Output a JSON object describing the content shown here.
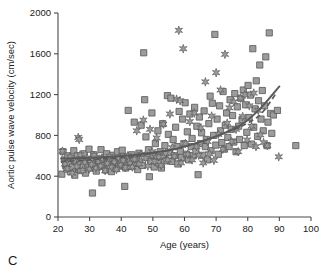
{
  "panel": {
    "letter": "C"
  },
  "chart_data": {
    "type": "scatter",
    "title": "",
    "xlabel": "Age (years)",
    "ylabel": "Aortic pulse wave velocity (cm/sec)",
    "xlim": [
      20,
      100
    ],
    "ylim": [
      0,
      2000
    ],
    "xticks": [
      20,
      30,
      40,
      50,
      60,
      70,
      80,
      90,
      100
    ],
    "yticks": [
      0,
      400,
      800,
      1200,
      1600,
      2000
    ],
    "xtick_labels": [
      "20",
      "30",
      "40",
      "50",
      "60",
      "70",
      "80",
      "90",
      "100"
    ],
    "ytick_labels": [
      "0",
      "400",
      "800",
      "1200",
      "1600",
      "2000"
    ],
    "grid": false,
    "legend": "none",
    "colors": {
      "marker_fill": "#9c9c9c",
      "marker_edge": "#5c5c5c",
      "trend_line": "#595959",
      "axis": "#4a4a4a"
    },
    "series": [
      {
        "name": "squares",
        "marker": "square",
        "points": [
          [
            21.2,
            420
          ],
          [
            21.6,
            640
          ],
          [
            22.0,
            560
          ],
          [
            22.4,
            505
          ],
          [
            22.8,
            470
          ],
          [
            23.1,
            600
          ],
          [
            23.5,
            525
          ],
          [
            23.9,
            445
          ],
          [
            24.2,
            575
          ],
          [
            24.6,
            490
          ],
          [
            25.0,
            650
          ],
          [
            25.3,
            410
          ],
          [
            25.7,
            540
          ],
          [
            26.1,
            600
          ],
          [
            26.5,
            470
          ],
          [
            26.8,
            515
          ],
          [
            27.2,
            455
          ],
          [
            27.6,
            585
          ],
          [
            28.0,
            500
          ],
          [
            28.3,
            620
          ],
          [
            28.7,
            430
          ],
          [
            29.1,
            545
          ],
          [
            29.5,
            490
          ],
          [
            29.8,
            665
          ],
          [
            30.2,
            560
          ],
          [
            30.6,
            480
          ],
          [
            30.9,
            235
          ],
          [
            31.3,
            610
          ],
          [
            31.7,
            520
          ],
          [
            32.1,
            450
          ],
          [
            32.4,
            575
          ],
          [
            32.8,
            495
          ],
          [
            33.2,
            540
          ],
          [
            33.6,
            660
          ],
          [
            33.9,
            335
          ],
          [
            34.3,
            505
          ],
          [
            34.7,
            585
          ],
          [
            35.1,
            460
          ],
          [
            35.4,
            620
          ],
          [
            35.8,
            530
          ],
          [
            36.2,
            490
          ],
          [
            36.6,
            570
          ],
          [
            36.9,
            445
          ],
          [
            37.3,
            605
          ],
          [
            37.7,
            515
          ],
          [
            38.1,
            550
          ],
          [
            38.4,
            475
          ],
          [
            38.8,
            640
          ],
          [
            39.2,
            500
          ],
          [
            39.6,
            560
          ],
          [
            39.9,
            530
          ],
          [
            40.3,
            655
          ],
          [
            40.7,
            590
          ],
          [
            41.1,
            300
          ],
          [
            41.4,
            480
          ],
          [
            41.8,
            520
          ],
          [
            42.2,
            1045
          ],
          [
            42.6,
            560
          ],
          [
            42.9,
            495
          ],
          [
            43.3,
            610
          ],
          [
            43.7,
            545
          ],
          [
            44.1,
            930
          ],
          [
            44.4,
            505
          ],
          [
            44.8,
            580
          ],
          [
            45.2,
            465
          ],
          [
            45.6,
            625
          ],
          [
            45.9,
            540
          ],
          [
            46.3,
            900
          ],
          [
            46.7,
            505
          ],
          [
            47.1,
            1610
          ],
          [
            47.4,
            1150
          ],
          [
            47.8,
            785
          ],
          [
            48.2,
            585
          ],
          [
            48.6,
            660
          ],
          [
            48.9,
            395
          ],
          [
            49.3,
            545
          ],
          [
            49.7,
            1020
          ],
          [
            50.1,
            610
          ],
          [
            50.4,
            490
          ],
          [
            50.8,
            720
          ],
          [
            51.2,
            570
          ],
          [
            51.6,
            845
          ],
          [
            51.9,
            530
          ],
          [
            52.3,
            640
          ],
          [
            52.7,
            480
          ],
          [
            53.1,
            915
          ],
          [
            53.4,
            595
          ],
          [
            53.8,
            700
          ],
          [
            54.2,
            550
          ],
          [
            54.6,
            1190
          ],
          [
            54.9,
            810
          ],
          [
            55.3,
            630
          ],
          [
            55.7,
            1165
          ],
          [
            56.1,
            545
          ],
          [
            56.4,
            760
          ],
          [
            56.8,
            600
          ],
          [
            57.2,
            880
          ],
          [
            57.6,
            690
          ],
          [
            57.9,
            520
          ],
          [
            58.3,
            1035
          ],
          [
            58.7,
            640
          ],
          [
            59.1,
            585
          ],
          [
            59.4,
            960
          ],
          [
            59.8,
            720
          ],
          [
            60.2,
            1120
          ],
          [
            60.6,
            615
          ],
          [
            60.9,
            835
          ],
          [
            61.3,
            560
          ],
          [
            61.7,
            1010
          ],
          [
            62.1,
            690
          ],
          [
            62.4,
            770
          ],
          [
            62.8,
            600
          ],
          [
            63.2,
            1075
          ],
          [
            63.6,
            645
          ],
          [
            63.9,
            890
          ],
          [
            64.3,
            415
          ],
          [
            64.7,
            980
          ],
          [
            65.1,
            720
          ],
          [
            65.4,
            825
          ],
          [
            65.8,
            605
          ],
          [
            66.2,
            1040
          ],
          [
            66.6,
            690
          ],
          [
            66.9,
            760
          ],
          [
            67.3,
            560
          ],
          [
            67.7,
            915
          ],
          [
            68.1,
            1185
          ],
          [
            68.4,
            650
          ],
          [
            68.8,
            1115
          ],
          [
            69.2,
            800
          ],
          [
            69.6,
            1790
          ],
          [
            69.9,
            705
          ],
          [
            70.3,
            960
          ],
          [
            70.7,
            615
          ],
          [
            71.1,
            1090
          ],
          [
            71.4,
            845
          ],
          [
            71.8,
            730
          ],
          [
            72.2,
            1230
          ],
          [
            72.6,
            665
          ],
          [
            72.9,
            900
          ],
          [
            73.3,
            1020
          ],
          [
            73.7,
            780
          ],
          [
            74.1,
            690
          ],
          [
            74.4,
            1150
          ],
          [
            74.8,
            860
          ],
          [
            75.2,
            995
          ],
          [
            75.6,
            735
          ],
          [
            75.9,
            1210
          ],
          [
            76.3,
            640
          ],
          [
            76.7,
            1080
          ],
          [
            77.1,
            890
          ],
          [
            77.4,
            760
          ],
          [
            77.8,
            1165
          ],
          [
            78.2,
            955
          ],
          [
            78.6,
            1245
          ],
          [
            78.9,
            700
          ],
          [
            79.3,
            1100
          ],
          [
            79.7,
            830
          ],
          [
            80.1,
            1290
          ],
          [
            80.4,
            975
          ],
          [
            80.8,
            1195
          ],
          [
            81.2,
            715
          ],
          [
            81.6,
            1650
          ],
          [
            81.9,
            880
          ],
          [
            82.3,
            1060
          ],
          [
            82.7,
            1335
          ],
          [
            83.1,
            790
          ],
          [
            83.4,
            1140
          ],
          [
            83.8,
            1490
          ],
          [
            84.2,
            960
          ],
          [
            84.6,
            1240
          ],
          [
            84.9,
            845
          ],
          [
            85.3,
            1090
          ],
          [
            85.7,
            1570
          ],
          [
            86.1,
            700
          ],
          [
            86.4,
            930
          ],
          [
            86.8,
            1805
          ],
          [
            87.2,
            1015
          ],
          [
            87.6,
            820
          ],
          [
            88.1,
            1000
          ],
          [
            89.4,
            1045
          ],
          [
            95.2,
            700
          ]
        ]
      },
      {
        "name": "stars",
        "marker": "star",
        "points": [
          [
            21.4,
            645
          ],
          [
            22.2,
            520
          ],
          [
            23.0,
            475
          ],
          [
            23.8,
            590
          ],
          [
            24.5,
            430
          ],
          [
            25.2,
            550
          ],
          [
            25.9,
            495
          ],
          [
            26.4,
            780
          ],
          [
            26.7,
            760
          ],
          [
            27.0,
            610
          ],
          [
            27.8,
            455
          ],
          [
            28.5,
            535
          ],
          [
            29.2,
            580
          ],
          [
            29.9,
            470
          ],
          [
            30.6,
            515
          ],
          [
            31.4,
            605
          ],
          [
            32.0,
            480
          ],
          [
            32.7,
            545
          ],
          [
            33.5,
            500
          ],
          [
            34.2,
            570
          ],
          [
            34.9,
            455
          ],
          [
            35.6,
            525
          ],
          [
            36.3,
            595
          ],
          [
            37.0,
            490
          ],
          [
            37.8,
            540
          ],
          [
            38.5,
            465
          ],
          [
            39.2,
            580
          ],
          [
            39.9,
            510
          ],
          [
            40.6,
            555
          ],
          [
            41.3,
            485
          ],
          [
            42.0,
            600
          ],
          [
            42.8,
            530
          ],
          [
            43.5,
            490
          ],
          [
            44.2,
            565
          ],
          [
            44.9,
            845
          ],
          [
            45.6,
            520
          ],
          [
            46.3,
            615
          ],
          [
            47.0,
            950
          ],
          [
            47.7,
            575
          ],
          [
            48.4,
            500
          ],
          [
            49.1,
            860
          ],
          [
            49.8,
            640
          ],
          [
            50.5,
            545
          ],
          [
            51.2,
            775
          ],
          [
            51.9,
            590
          ],
          [
            52.6,
            505
          ],
          [
            53.3,
            910
          ],
          [
            54.0,
            625
          ],
          [
            54.7,
            560
          ],
          [
            55.4,
            1010
          ],
          [
            56.1,
            680
          ],
          [
            56.8,
            595
          ],
          [
            57.5,
            1155
          ],
          [
            58.2,
            1830
          ],
          [
            58.6,
            1140
          ],
          [
            58.9,
            530
          ],
          [
            59.6,
            1650
          ],
          [
            60.3,
            720
          ],
          [
            61.0,
            615
          ],
          [
            61.7,
            935
          ],
          [
            62.4,
            560
          ],
          [
            63.1,
            1020
          ],
          [
            63.8,
            690
          ],
          [
            64.5,
            605
          ],
          [
            65.2,
            875
          ],
          [
            65.9,
            530
          ],
          [
            66.6,
            1325
          ],
          [
            67.3,
            740
          ],
          [
            67.9,
            620
          ],
          [
            68.6,
            990
          ],
          [
            69.3,
            555
          ],
          [
            70.0,
            1415
          ],
          [
            70.7,
            810
          ],
          [
            71.4,
            1245
          ],
          [
            72.1,
            665
          ],
          [
            72.8,
            1595
          ],
          [
            73.5,
            920
          ],
          [
            74.2,
            1070
          ],
          [
            74.9,
            740
          ],
          [
            75.6,
            1130
          ],
          [
            76.3,
            860
          ],
          [
            77.0,
            640
          ],
          [
            77.7,
            1165
          ],
          [
            78.4,
            985
          ],
          [
            79.1,
            1200
          ],
          [
            79.8,
            755
          ],
          [
            80.5,
            1090
          ],
          [
            81.2,
            890
          ],
          [
            81.9,
            1215
          ],
          [
            82.6,
            690
          ],
          [
            83.3,
            1045
          ],
          [
            84.0,
            805
          ],
          [
            85.0,
            730
          ],
          [
            86.2,
            700
          ],
          [
            89.8,
            590
          ]
        ]
      }
    ],
    "trend_lines": [
      {
        "name": "solid-fit",
        "style": "solid",
        "points": [
          [
            21,
            573
          ],
          [
            30,
            580
          ],
          [
            40,
            598
          ],
          [
            50,
            630
          ],
          [
            60,
            690
          ],
          [
            70,
            790
          ],
          [
            78,
            905
          ],
          [
            84,
            1065
          ],
          [
            90,
            1280
          ]
        ]
      },
      {
        "name": "dashed-fit",
        "style": "dashed",
        "points": [
          [
            21,
            545
          ],
          [
            30,
            560
          ],
          [
            40,
            585
          ],
          [
            50,
            625
          ],
          [
            60,
            690
          ],
          [
            70,
            790
          ],
          [
            78,
            890
          ],
          [
            84,
            1005
          ],
          [
            89,
            1215
          ]
        ]
      }
    ]
  }
}
